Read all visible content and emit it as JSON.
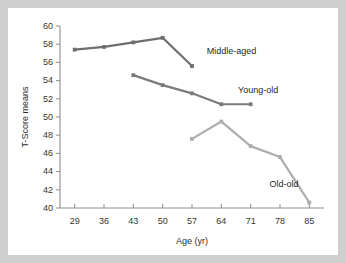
{
  "chart_data": {
    "type": "line",
    "title": "",
    "subtitle": "",
    "xlabel": "Age (yr)",
    "ylabel": "T-Score means",
    "x": [
      29,
      36,
      43,
      50,
      57,
      64,
      71,
      78,
      85
    ],
    "xticklabels": [
      "29",
      "36",
      "43",
      "50",
      "57",
      "64",
      "71",
      "78",
      "85"
    ],
    "yticks": [
      40,
      42,
      44,
      46,
      48,
      50,
      52,
      54,
      56,
      58,
      60
    ],
    "yticklabels": [
      "40",
      "42",
      "44",
      "46",
      "48",
      "50",
      "52",
      "54",
      "56",
      "58",
      "60"
    ],
    "ylim": [
      40,
      60
    ],
    "xlim": [
      25.5,
      88.5
    ],
    "grid": false,
    "legend_position": "inline-annotations",
    "series": [
      {
        "name": "Middle-aged",
        "color": "#6e6e6e",
        "marker": "square",
        "x": [
          29,
          36,
          43,
          50,
          57
        ],
        "values": [
          57.4,
          57.7,
          58.2,
          58.7,
          55.6
        ]
      },
      {
        "name": "Young-old",
        "color": "#7b7b7b",
        "marker": "square",
        "x": [
          43,
          50,
          57,
          64,
          71
        ],
        "values": [
          54.6,
          53.5,
          52.6,
          51.4,
          51.4
        ]
      },
      {
        "name": "Old-old",
        "color": "#adadad",
        "marker": "square",
        "x": [
          57,
          64,
          71,
          78,
          85
        ],
        "values": [
          47.6,
          49.5,
          46.8,
          45.6,
          40.6
        ]
      }
    ],
    "annotations": [
      {
        "text": "Middle-aged",
        "x": 60.5,
        "y": 56.9
      },
      {
        "text": "Young-old",
        "x": 68.0,
        "y": 52.6
      },
      {
        "text": "Old-old",
        "x": 75.5,
        "y": 42.3
      }
    ],
    "colors": {
      "background": "#ffffff",
      "outer_background": "#cfcfcf",
      "axis": "#8d8d8d",
      "text": "#2b2b2b"
    }
  }
}
